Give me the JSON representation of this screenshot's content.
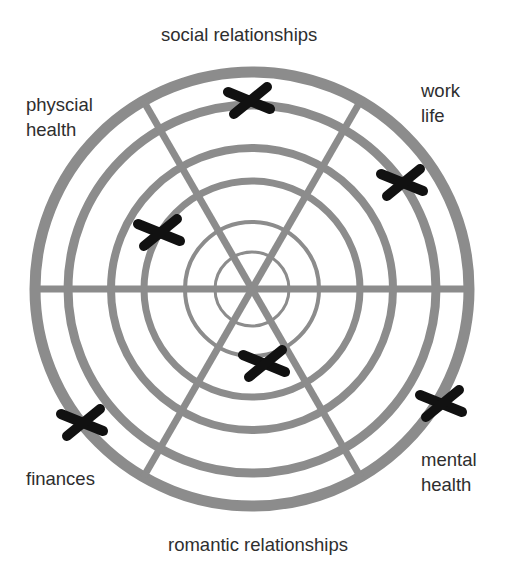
{
  "diagram": {
    "center": {
      "x": 252,
      "y": 289
    },
    "ring_color": "#8c8c8c",
    "mark_color": "#111111",
    "rings": [
      {
        "r": 217,
        "w": 11
      },
      {
        "r": 184,
        "w": 9
      },
      {
        "r": 141,
        "w": 8
      },
      {
        "r": 108,
        "w": 7
      },
      {
        "r": 67,
        "w": 4
      },
      {
        "r": 37,
        "w": 3
      }
    ],
    "spoke_width": 7,
    "spoke_angles_deg": [
      0,
      60,
      120
    ],
    "labels": [
      {
        "id": "social-relationships",
        "lines": [
          "social relationships"
        ],
        "x": 161,
        "y": 22
      },
      {
        "id": "physical-health",
        "lines": [
          "physcial",
          "health"
        ],
        "x": 26,
        "y": 92
      },
      {
        "id": "work-life",
        "lines": [
          "work",
          "life"
        ],
        "x": 421,
        "y": 78
      },
      {
        "id": "mental-health",
        "lines": [
          "mental",
          "health"
        ],
        "x": 421,
        "y": 447
      },
      {
        "id": "finances",
        "lines": [
          "finances"
        ],
        "x": 26,
        "y": 466
      },
      {
        "id": "romantic-relationships",
        "lines": [
          "romantic relationships"
        ],
        "x": 168,
        "y": 532
      }
    ],
    "marks": [
      {
        "category": "social relationships",
        "x": 250,
        "y": 100,
        "icon": "x-mark-icon"
      },
      {
        "category": "work life",
        "x": 403,
        "y": 182,
        "icon": "x-mark-icon"
      },
      {
        "category": "physical health",
        "x": 160,
        "y": 232,
        "icon": "x-mark-icon"
      },
      {
        "category": "romantic relationships",
        "x": 265,
        "y": 363,
        "icon": "x-mark-icon"
      },
      {
        "category": "mental health",
        "x": 442,
        "y": 403,
        "icon": "x-mark-icon"
      },
      {
        "category": "finances",
        "x": 83,
        "y": 422,
        "icon": "x-mark-icon"
      }
    ]
  }
}
